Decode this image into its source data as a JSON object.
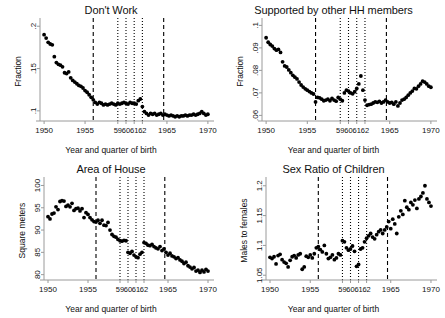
{
  "figure": {
    "title": "",
    "common_xlabel": "Year and quarter of birth",
    "xlim": [
      1949.5,
      1970.5
    ],
    "xticks": [
      1950,
      1955,
      1959,
      1960,
      1961,
      1962,
      1965,
      1970
    ],
    "xticklabels": [
      "1950",
      "1955",
      "59",
      "60",
      "61",
      "62",
      "1965",
      "1970"
    ],
    "reference_lines": {
      "dashed": [
        1956.0,
        1964.6
      ],
      "dotted": [
        1959.0,
        1960.0,
        1961.0,
        1962.0
      ]
    },
    "marker_color": "#000000",
    "line_color": "#000000",
    "axis_color": "#888888",
    "marker_style": "filled-circle"
  },
  "chart_data": [
    {
      "type": "scatter",
      "panel": 1,
      "title": "Don't Work",
      "xlabel": "Year and quarter of birth",
      "ylabel": "Fraction",
      "xlim": [
        1949.5,
        1970.5
      ],
      "ylim": [
        0.088,
        0.205
      ],
      "yticks": [
        0.1,
        0.15,
        0.2
      ],
      "yticklabels": [
        ".1",
        ".15",
        ".2"
      ],
      "grid": false,
      "legend": "none",
      "x": [
        1950.0,
        1950.25,
        1950.5,
        1950.75,
        1951.0,
        1951.25,
        1951.5,
        1951.75,
        1952.0,
        1952.25,
        1952.5,
        1952.75,
        1953.0,
        1953.25,
        1953.5,
        1953.75,
        1954.0,
        1954.25,
        1954.5,
        1954.75,
        1955.0,
        1955.25,
        1955.5,
        1955.75,
        1956.0,
        1956.25,
        1956.5,
        1956.75,
        1957.0,
        1957.25,
        1957.5,
        1957.75,
        1958.0,
        1958.25,
        1958.5,
        1958.75,
        1959.0,
        1959.25,
        1959.5,
        1959.75,
        1960.0,
        1960.25,
        1960.5,
        1960.75,
        1961.0,
        1961.25,
        1961.5,
        1961.75,
        1962.0,
        1962.25,
        1962.5,
        1962.75,
        1963.0,
        1963.25,
        1963.5,
        1963.75,
        1964.0,
        1964.25,
        1964.5,
        1964.75,
        1965.0,
        1965.25,
        1965.5,
        1965.75,
        1966.0,
        1966.25,
        1966.5,
        1966.75,
        1967.0,
        1967.25,
        1967.5,
        1967.75,
        1968.0,
        1968.25,
        1968.5,
        1968.75,
        1969.0,
        1969.25,
        1969.5,
        1969.75,
        1970.0
      ],
      "y": [
        0.19,
        0.186,
        0.181,
        0.179,
        0.178,
        0.164,
        0.157,
        0.155,
        0.154,
        0.152,
        0.145,
        0.144,
        0.146,
        0.139,
        0.136,
        0.134,
        0.132,
        0.13,
        0.129,
        0.127,
        0.124,
        0.122,
        0.119,
        0.116,
        0.113,
        0.11,
        0.108,
        0.11,
        0.109,
        0.107,
        0.108,
        0.107,
        0.108,
        0.109,
        0.108,
        0.107,
        0.109,
        0.108,
        0.109,
        0.11,
        0.109,
        0.108,
        0.11,
        0.109,
        0.109,
        0.108,
        0.112,
        0.114,
        0.105,
        0.099,
        0.097,
        0.095,
        0.097,
        0.096,
        0.097,
        0.095,
        0.096,
        0.097,
        0.095,
        0.096,
        0.095,
        0.094,
        0.095,
        0.094,
        0.093,
        0.094,
        0.093,
        0.094,
        0.094,
        0.095,
        0.094,
        0.095,
        0.095,
        0.096,
        0.095,
        0.096,
        0.097,
        0.099,
        0.097,
        0.095,
        0.096
      ]
    },
    {
      "type": "scatter",
      "panel": 2,
      "title": "Supported by other HH members",
      "xlabel": "Year and quarter of birth",
      "ylabel": "Fraction",
      "xlim": [
        1949.5,
        1970.5
      ],
      "ylim": [
        0.0575,
        0.1015
      ],
      "yticks": [
        0.06,
        0.07,
        0.08,
        0.09,
        0.1
      ],
      "yticklabels": [
        ".06",
        ".07",
        ".08",
        ".09",
        ".1"
      ],
      "grid": false,
      "legend": "none",
      "x": [
        1950.0,
        1950.25,
        1950.5,
        1950.75,
        1951.0,
        1951.25,
        1951.5,
        1951.75,
        1952.0,
        1952.25,
        1952.5,
        1952.75,
        1953.0,
        1953.25,
        1953.5,
        1953.75,
        1954.0,
        1954.25,
        1954.5,
        1954.75,
        1955.0,
        1955.25,
        1955.5,
        1955.75,
        1956.0,
        1956.25,
        1956.5,
        1956.75,
        1957.0,
        1957.25,
        1957.5,
        1957.75,
        1958.0,
        1958.25,
        1958.5,
        1958.75,
        1959.0,
        1959.25,
        1959.5,
        1959.75,
        1960.0,
        1960.25,
        1960.5,
        1960.75,
        1961.0,
        1961.25,
        1961.5,
        1961.75,
        1962.0,
        1962.25,
        1962.5,
        1962.75,
        1963.0,
        1963.25,
        1963.5,
        1963.75,
        1964.0,
        1964.25,
        1964.5,
        1964.75,
        1965.0,
        1965.25,
        1965.5,
        1965.75,
        1966.0,
        1966.25,
        1966.5,
        1966.75,
        1967.0,
        1967.25,
        1967.5,
        1967.75,
        1968.0,
        1968.25,
        1968.5,
        1968.75,
        1969.0,
        1969.25,
        1969.5,
        1969.75,
        1970.0
      ],
      "y": [
        0.0945,
        0.0925,
        0.0915,
        0.0908,
        0.0897,
        0.089,
        0.0893,
        0.088,
        0.0838,
        0.082,
        0.0815,
        0.0802,
        0.079,
        0.0778,
        0.077,
        0.0762,
        0.0748,
        0.0735,
        0.0726,
        0.0718,
        0.0712,
        0.0706,
        0.07,
        0.0695,
        0.066,
        0.068,
        0.0678,
        0.0672,
        0.0665,
        0.0668,
        0.0672,
        0.0665,
        0.0675,
        0.0668,
        0.0663,
        0.068,
        0.0672,
        0.0665,
        0.07,
        0.0712,
        0.0708,
        0.07,
        0.0696,
        0.0705,
        0.072,
        0.074,
        0.0775,
        0.0712,
        0.0668,
        0.0645,
        0.0648,
        0.065,
        0.0655,
        0.066,
        0.0658,
        0.0662,
        0.0655,
        0.066,
        0.0668,
        0.066,
        0.0655,
        0.0658,
        0.065,
        0.066,
        0.0642,
        0.0655,
        0.0668,
        0.0672,
        0.068,
        0.069,
        0.07,
        0.0708,
        0.072,
        0.0718,
        0.073,
        0.074,
        0.0752,
        0.0748,
        0.074,
        0.073,
        0.0725
      ]
    },
    {
      "type": "scatter",
      "panel": 3,
      "title": "Area of House",
      "xlabel": "Year and quarter of birth",
      "ylabel": "Square meters",
      "xlim": [
        1949.5,
        1970.5
      ],
      "ylim": [
        78.8,
        101.0
      ],
      "yticks": [
        80,
        85,
        90,
        95,
        100
      ],
      "yticklabels": [
        "80",
        "85",
        "90",
        "95",
        "100"
      ],
      "grid": false,
      "legend": "none",
      "x": [
        1950.0,
        1950.25,
        1950.5,
        1950.75,
        1951.0,
        1951.25,
        1951.5,
        1951.75,
        1952.0,
        1952.25,
        1952.5,
        1952.75,
        1953.0,
        1953.25,
        1953.5,
        1953.75,
        1954.0,
        1954.25,
        1954.5,
        1954.75,
        1955.0,
        1955.25,
        1955.5,
        1955.75,
        1956.0,
        1956.25,
        1956.5,
        1956.75,
        1957.0,
        1957.25,
        1957.5,
        1957.75,
        1958.0,
        1958.25,
        1958.5,
        1958.75,
        1959.0,
        1959.25,
        1959.5,
        1959.75,
        1960.0,
        1960.25,
        1960.5,
        1960.75,
        1961.0,
        1961.25,
        1961.5,
        1961.75,
        1962.0,
        1962.25,
        1962.5,
        1962.75,
        1963.0,
        1963.25,
        1963.5,
        1963.75,
        1964.0,
        1964.25,
        1964.5,
        1964.75,
        1965.0,
        1965.25,
        1965.5,
        1965.75,
        1966.0,
        1966.25,
        1966.5,
        1966.75,
        1967.0,
        1967.25,
        1967.5,
        1967.75,
        1968.0,
        1968.25,
        1968.5,
        1968.75,
        1969.0,
        1969.25,
        1969.5,
        1969.75,
        1970.0
      ],
      "y": [
        93.0,
        92.5,
        93.6,
        93.8,
        95.2,
        94.6,
        96.4,
        96.6,
        96.5,
        95.3,
        95.6,
        95.2,
        96.0,
        94.4,
        94.8,
        94.9,
        94.3,
        94.8,
        92.8,
        93.9,
        93.5,
        92.8,
        92.3,
        91.9,
        91.8,
        92.2,
        91.5,
        92.2,
        91.1,
        91.0,
        91.7,
        90.0,
        89.0,
        88.6,
        88.4,
        87.9,
        87.6,
        87.5,
        87.7,
        87.6,
        85.0,
        84.8,
        85.2,
        84.4,
        84.0,
        83.8,
        84.6,
        85.0,
        87.2,
        87.0,
        86.6,
        86.5,
        86.8,
        86.3,
        86.0,
        85.8,
        86.3,
        85.4,
        85.8,
        85.0,
        84.4,
        84.8,
        84.2,
        84.0,
        83.6,
        83.8,
        83.3,
        83.0,
        82.5,
        82.8,
        82.0,
        81.7,
        81.3,
        81.6,
        80.8,
        81.0,
        80.5,
        81.0,
        80.6,
        81.2,
        80.8
      ]
    },
    {
      "type": "scatter",
      "panel": 4,
      "title": "Sex Ratio of Children",
      "xlabel": "Year and quarter of birth",
      "ylabel": "Males to females",
      "xlim": [
        1949.5,
        1970.5
      ],
      "ylim": [
        1.042,
        1.208
      ],
      "yticks": [
        1.05,
        1.1,
        1.15,
        1.2
      ],
      "yticklabels": [
        "1.05",
        "1.1",
        "1.15",
        "1.2"
      ],
      "grid": false,
      "legend": "none",
      "x": [
        1950.0,
        1950.25,
        1950.5,
        1950.75,
        1951.0,
        1951.25,
        1951.5,
        1951.75,
        1952.0,
        1952.25,
        1952.5,
        1952.75,
        1953.0,
        1953.25,
        1953.5,
        1953.75,
        1954.0,
        1954.25,
        1954.5,
        1954.75,
        1955.0,
        1955.25,
        1955.5,
        1955.75,
        1956.0,
        1956.25,
        1956.5,
        1956.75,
        1957.0,
        1957.25,
        1957.5,
        1957.75,
        1958.0,
        1958.25,
        1958.5,
        1958.75,
        1959.0,
        1959.25,
        1959.5,
        1959.75,
        1960.0,
        1960.25,
        1960.5,
        1960.75,
        1961.0,
        1961.25,
        1961.5,
        1961.75,
        1962.0,
        1962.25,
        1962.5,
        1962.75,
        1963.0,
        1963.25,
        1963.5,
        1963.75,
        1964.0,
        1964.25,
        1964.5,
        1964.75,
        1965.0,
        1965.25,
        1965.5,
        1965.75,
        1966.0,
        1966.25,
        1966.5,
        1966.75,
        1967.0,
        1967.25,
        1967.5,
        1967.75,
        1968.0,
        1968.25,
        1968.5,
        1968.75,
        1969.0,
        1969.25,
        1969.5,
        1969.75,
        1970.0
      ],
      "y": [
        1.08,
        1.078,
        1.081,
        1.069,
        1.083,
        1.085,
        1.076,
        1.072,
        1.07,
        1.064,
        1.075,
        1.081,
        1.083,
        1.079,
        1.084,
        1.086,
        1.06,
        1.064,
        1.082,
        1.08,
        1.084,
        1.079,
        1.086,
        1.096,
        1.098,
        1.093,
        1.089,
        1.1,
        1.086,
        1.078,
        1.08,
        1.084,
        1.076,
        1.079,
        1.086,
        1.084,
        1.108,
        1.106,
        1.096,
        1.092,
        1.094,
        1.099,
        1.09,
        1.065,
        1.068,
        1.094,
        1.096,
        1.106,
        1.112,
        1.116,
        1.12,
        1.114,
        1.111,
        1.118,
        1.123,
        1.126,
        1.12,
        1.126,
        1.131,
        1.14,
        1.128,
        1.144,
        1.136,
        1.12,
        1.148,
        1.158,
        1.152,
        1.175,
        1.164,
        1.16,
        1.172,
        1.168,
        1.176,
        1.162,
        1.178,
        1.182,
        1.188,
        1.2,
        1.178,
        1.172,
        1.166
      ]
    }
  ]
}
